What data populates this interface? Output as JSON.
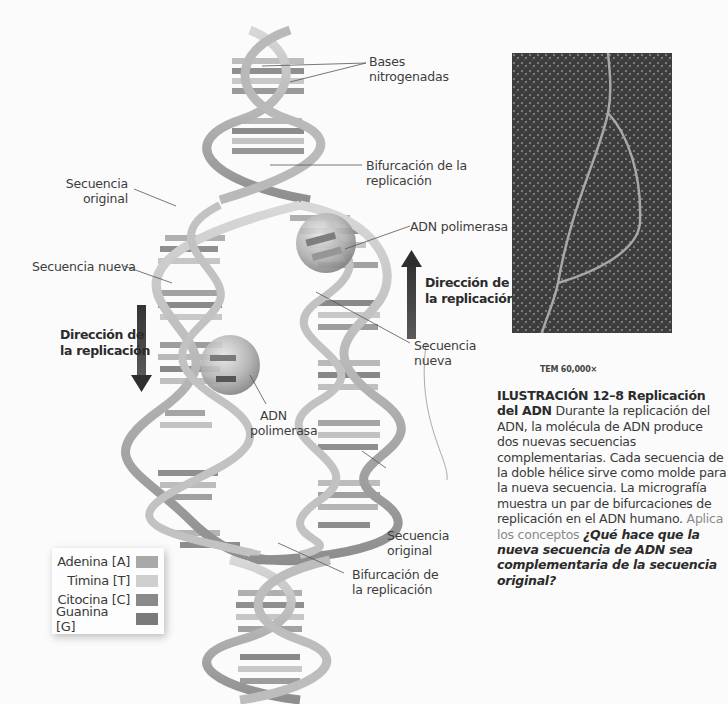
{
  "diagram": {
    "labels": {
      "bases": [
        "Bases",
        "nitrogenadas"
      ],
      "fork_top": [
        "Bifurcación de la",
        "replicación"
      ],
      "original_left": [
        "Secuencia",
        "original"
      ],
      "polymerase_top": "ADN polimerasa",
      "new_left": "Secuencia nueva",
      "direction_right": [
        "Dirección de",
        "la replicación"
      ],
      "direction_left": [
        "Dirección de",
        "la replicación"
      ],
      "new_right": [
        "Secuencia",
        "nueva"
      ],
      "polymerase_bottom": [
        "ADN",
        "polimerasa"
      ],
      "original_right": [
        "Secuencia",
        "original"
      ],
      "fork_bottom": [
        "Bifurcación de",
        "la replicación"
      ]
    },
    "legend": [
      {
        "label": "Adenina [A]",
        "color": "#a9a9a9"
      },
      {
        "label": "Timina [T]",
        "color": "#cfcfcf"
      },
      {
        "label": "Citocina [C]",
        "color": "#8a8a8a"
      },
      {
        "label": "Guanina [G]",
        "color": "#7a7a7a"
      }
    ]
  },
  "micrograph": {
    "magnification": "TEM 60,000×"
  },
  "caption": {
    "figure_number": "ILUSTRACIÓN 12–8",
    "title": "Replicación del ADN",
    "body": "Durante la replicación del ADN, la molécula de ADN produce dos nuevas secuencias complementarias. Cada secuencia de la doble hélice sirve como molde para la nueva secuencia. La micrografía muestra un par de bifurcaciones de replicación en el ADN humano.",
    "concept_label": "Aplica los conceptos",
    "question": "¿Qué hace que la nueva secuencia de ADN sea complementaria de la secuencia original?"
  }
}
